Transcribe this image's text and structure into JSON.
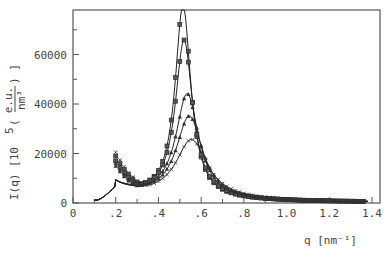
{
  "chart_data": {
    "type": "line",
    "title": "",
    "xlabel": "q  [nm⁻¹]",
    "ylabel": "I(q)  [10⁵ (e.u./nm³)]",
    "ylabel_parts": {
      "main": "I(q)  [10",
      "exp": "5",
      "paren_open": " (",
      "num": "e.u.",
      "den": "nm³",
      "paren_close": ") ]"
    },
    "xlim": [
      0,
      1.4
    ],
    "ylim": [
      0,
      78000
    ],
    "grid": false,
    "legend": null,
    "x_ticks": [
      0,
      0.2,
      0.4,
      0.6,
      0.8,
      1.0,
      1.2,
      1.4
    ],
    "x_tick_labels": [
      "0",
      ".2",
      ".4",
      ".6",
      ".8",
      "1.0",
      "1.2",
      "1.4"
    ],
    "x_minor_ticks": [
      0.1,
      0.3,
      0.5,
      0.7,
      0.9,
      1.1,
      1.3
    ],
    "y_ticks": [
      0,
      20000,
      40000,
      60000
    ],
    "y_tick_labels": [
      "0",
      "20000",
      "40000",
      "60000"
    ],
    "y_minor_ticks": [
      10000,
      30000,
      50000,
      70000
    ],
    "fit_curve_range": [
      0.1,
      1.38
    ],
    "series": [
      {
        "name": "series-1",
        "marker": "square",
        "peak_q": 0.515,
        "peak_I": 78000,
        "width": 0.045,
        "low_q_upturn": 19000
      },
      {
        "name": "series-2",
        "marker": "square",
        "peak_q": 0.52,
        "peak_I": 64000,
        "width": 0.05,
        "low_q_upturn": 17000
      },
      {
        "name": "series-3",
        "marker": "triangle",
        "peak_q": 0.535,
        "peak_I": 42500,
        "width": 0.065,
        "low_q_upturn": 16000
      },
      {
        "name": "series-4",
        "marker": "triangle",
        "peak_q": 0.545,
        "peak_I": 33500,
        "width": 0.075,
        "low_q_upturn": 15000
      },
      {
        "name": "series-5",
        "marker": "cross",
        "peak_q": 0.555,
        "peak_I": 24000,
        "width": 0.09,
        "low_q_upturn": 20500
      }
    ],
    "tail_values": {
      "q": [
        0.8,
        1.0,
        1.2,
        1.38
      ],
      "I": [
        6500,
        3500,
        2200,
        1600
      ]
    }
  }
}
